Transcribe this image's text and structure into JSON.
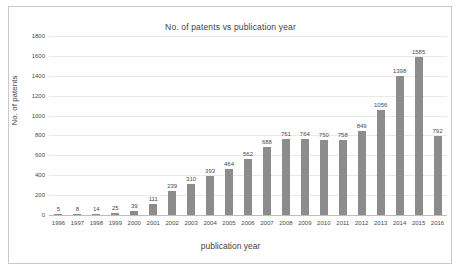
{
  "chart_data": {
    "type": "bar",
    "title": "No. of patents vs publication year",
    "xlabel": "publication year",
    "ylabel": "No. of patents",
    "categories": [
      "1996",
      "1997",
      "1998",
      "1999",
      "2000",
      "2001",
      "2002",
      "2003",
      "2004",
      "2005",
      "2006",
      "2007",
      "2008",
      "2009",
      "2010",
      "2011",
      "2012",
      "2013",
      "2014",
      "2015",
      "2016"
    ],
    "values": [
      5,
      8,
      14,
      25,
      39,
      111,
      239,
      310,
      393,
      464,
      562,
      688,
      761,
      764,
      750,
      758,
      849,
      1056,
      1398,
      1585,
      792
    ],
    "ylim": [
      0,
      1800
    ],
    "yticks": [
      0,
      200,
      400,
      600,
      800,
      1000,
      1200,
      1400,
      1600,
      1800
    ],
    "ytick_labels": [
      "0",
      "200",
      "400",
      "600",
      "800",
      "1000",
      "1200",
      "1400",
      "1600",
      "1800"
    ],
    "grid": true,
    "legend": false,
    "bar_color": "#8c8c8c",
    "data_labels": [
      "5",
      "8",
      "14",
      "25",
      "39",
      "111",
      "239",
      "310",
      "393",
      "464",
      "562",
      "688",
      "761",
      "764",
      "750",
      "758",
      "849",
      "1056",
      "1398",
      "1585",
      "792"
    ]
  },
  "figure": {
    "background": "#ffffff",
    "frame_color": "#c9c9c9",
    "grid_color": "#e9e9e9",
    "axis_color": "#bdbdbd",
    "text_color": "#4a4a4a"
  }
}
